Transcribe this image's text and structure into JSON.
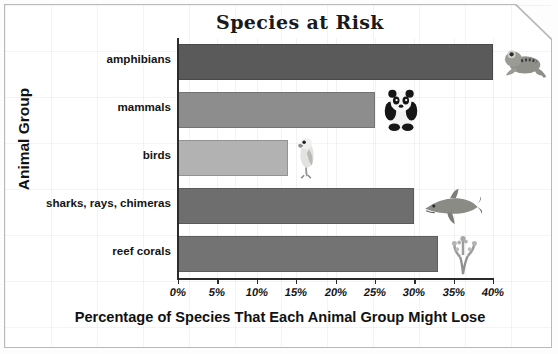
{
  "chart_data": {
    "type": "bar",
    "orientation": "horizontal",
    "title": "Species at Risk",
    "xlabel": "Percentage of Species That Each Animal Group Might Lose",
    "ylabel": "Animal Group",
    "categories": [
      "amphibians",
      "mammals",
      "birds",
      "sharks, rays, chimeras",
      "reef corals"
    ],
    "values": [
      40,
      25,
      14,
      30,
      33
    ],
    "value_suffix": "%",
    "xlim": [
      0,
      40
    ],
    "xtick_values": [
      0,
      5,
      10,
      15,
      20,
      25,
      30,
      35,
      40
    ],
    "xtick_labels": [
      "0%",
      "5%",
      "10%",
      "15%",
      "20%",
      "25%",
      "30%",
      "35%",
      "40%"
    ],
    "grid": false,
    "legend": "none",
    "bar_colors": [
      "#5a5a5a",
      "#8d8d8d",
      "#b2b2b2",
      "#6e6e6e",
      "#737373"
    ],
    "pictograms": [
      "frog-icon",
      "panda-icon",
      "parrot-icon",
      "shark-icon",
      "coral-icon"
    ]
  },
  "colors": {
    "axis": "#2b2b2b",
    "text": "#141414",
    "frame": "#b9b9b9",
    "background": "#ffffff"
  }
}
